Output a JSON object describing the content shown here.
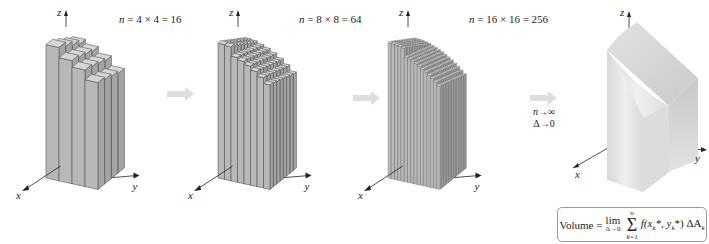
{
  "panels": [
    {
      "id": "p1",
      "label_n": "n",
      "label_expr": " = 4 × 4 = 16",
      "grid": 4
    },
    {
      "id": "p2",
      "label_n": "n",
      "label_expr": " = 8 × 8 = 64",
      "grid": 8
    },
    {
      "id": "p3",
      "label_n": "n",
      "label_expr": " = 16 × 16 = 256",
      "grid": 16
    },
    {
      "id": "p4",
      "label_n": "",
      "label_expr": "",
      "grid": 0
    }
  ],
  "axes": {
    "x": "x",
    "y": "y",
    "z": "z"
  },
  "limit_note": {
    "line1": "n→∞",
    "line2": "Δ→0"
  },
  "formula": {
    "lhs": "Volume =",
    "lim": "lim",
    "lim_sub": "Δ→0",
    "sum_top": "n",
    "sum_bottom": "k=1",
    "body": "f(x",
    "body2": "*, y",
    "body3": "*) ΔA",
    "k": "k"
  },
  "colors": {
    "bar_front": "#b8b8b8",
    "bar_side": "#a4a4a4",
    "bar_top": "#d6d6d6",
    "edge": "#555555",
    "arrow": "#dedede",
    "solid_front": "#e4e4e4",
    "solid_side": "#cfcfcf",
    "solid_top": "#d9d9d9"
  }
}
